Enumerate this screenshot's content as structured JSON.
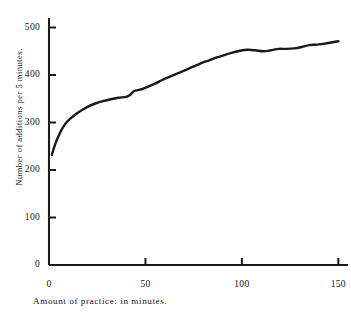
{
  "chart_data": {
    "type": "line",
    "title": "",
    "xlabel": "Amount of practice: in minutes.",
    "ylabel": "Number of additions per 5 minutes.",
    "xlim": [
      0,
      155
    ],
    "ylim": [
      0,
      520
    ],
    "xticks": [
      0,
      50,
      100,
      150
    ],
    "yticks": [
      0,
      100,
      200,
      300,
      400,
      500
    ],
    "xtick_labels": [
      "0",
      "50",
      "100",
      "150"
    ],
    "ytick_labels": [
      "0",
      "100",
      "200",
      "300",
      "400",
      "500"
    ],
    "grid": false,
    "legend": null,
    "series": [
      {
        "name": "additions per 5 minutes",
        "x": [
          1.5,
          3,
          5,
          7,
          9,
          11,
          14,
          17,
          20,
          24,
          28,
          32,
          36,
          40,
          42,
          44,
          46,
          48,
          51,
          55,
          59,
          63,
          67,
          71,
          75,
          79,
          83,
          87,
          91,
          95,
          99,
          103,
          107,
          111,
          115,
          119,
          123,
          127,
          131,
          135,
          139,
          143,
          147,
          150
        ],
        "y": [
          232,
          252,
          272,
          288,
          300,
          308,
          318,
          326,
          333,
          340,
          345,
          349,
          352,
          354,
          358,
          366,
          368,
          370,
          375,
          382,
          390,
          397,
          404,
          411,
          418,
          425,
          431,
          437,
          442,
          447,
          451,
          453,
          452,
          450,
          452,
          455,
          455,
          456,
          459,
          463,
          464,
          466,
          469,
          471
        ]
      }
    ]
  },
  "axis": {
    "y_title": "Number of additions per 5 minutes.",
    "x_title": "Amount of practice: in minutes."
  }
}
